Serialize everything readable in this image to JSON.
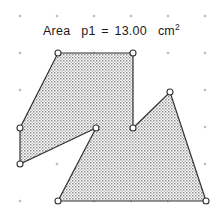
{
  "app": {
    "title": "Area p1 = 13.00 cm2",
    "background_color": "#ffffff"
  },
  "label": {
    "name": "Area",
    "object": "p1",
    "equals": "=",
    "value": "13.00",
    "unit": "cm",
    "exponent": "2",
    "full_text": "Area p1 = 13.00 cm2",
    "color": "#1a1a1a"
  },
  "canvas": {
    "width": 223,
    "height": 224,
    "grid": {
      "visible": true,
      "style": "dots",
      "color": "#9a9a9a",
      "spacing_px": 37,
      "x_positions": [
        20,
        57,
        94,
        131,
        168,
        205
      ],
      "y_positions": [
        16,
        53,
        90,
        127,
        164,
        201
      ]
    }
  },
  "polygon": {
    "label": "p1",
    "area_value": 13.0,
    "area_unit": "cm^2",
    "fill_pattern": "dotted-hatch",
    "fill_color": "#8d8d8d",
    "outline_color": "#333333",
    "outline_width": 1.2,
    "vertex_marker_fill": "#ffffff",
    "vertex_marker_stroke": "#333333",
    "vertices": [
      {
        "name": "A",
        "x": 58,
        "y": 53
      },
      {
        "name": "B",
        "x": 133,
        "y": 53
      },
      {
        "name": "C",
        "x": 133,
        "y": 128
      },
      {
        "name": "D",
        "x": 170,
        "y": 92
      },
      {
        "name": "E",
        "x": 206,
        "y": 201
      },
      {
        "name": "F",
        "x": 58,
        "y": 201
      },
      {
        "name": "G",
        "x": 96,
        "y": 128
      },
      {
        "name": "H",
        "x": 20,
        "y": 164
      },
      {
        "name": "I",
        "x": 20,
        "y": 128
      }
    ]
  },
  "chart_data": {
    "type": "scatter",
    "xlabel": "",
    "ylabel": "",
    "xlim": [
      0,
      223
    ],
    "ylim": [
      0,
      224
    ],
    "grid": true,
    "series": [
      {
        "name": "polygon p1 vertices",
        "x": [
          58,
          133,
          133,
          170,
          206,
          58,
          96,
          20,
          20
        ],
        "y": [
          53,
          53,
          128,
          92,
          201,
          201,
          128,
          164,
          128
        ]
      }
    ],
    "annotations": [
      "Area p1 = 13.00 cm2"
    ]
  }
}
